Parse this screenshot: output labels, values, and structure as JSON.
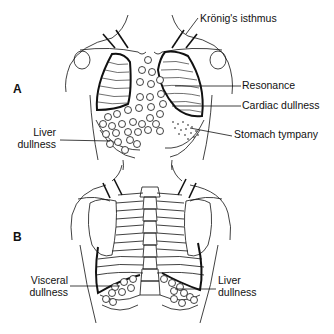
{
  "figure": {
    "panel_a": {
      "letter": "A",
      "view": "anterior",
      "labels": {
        "kronig": "Krönig's isthmus",
        "resonance": "Resonance",
        "cardiac": "Cardiac dullness",
        "stomach": "Stomach tympany",
        "liver_line1": "Liver",
        "liver_line2": "dullness"
      }
    },
    "panel_b": {
      "letter": "B",
      "view": "posterior",
      "labels": {
        "visceral_line1": "Visceral",
        "visceral_line2": "dullness",
        "liver_line1": "Liver",
        "liver_line2": "dullness"
      }
    },
    "colors": {
      "ink": "#111111",
      "background": "#ffffff"
    }
  }
}
